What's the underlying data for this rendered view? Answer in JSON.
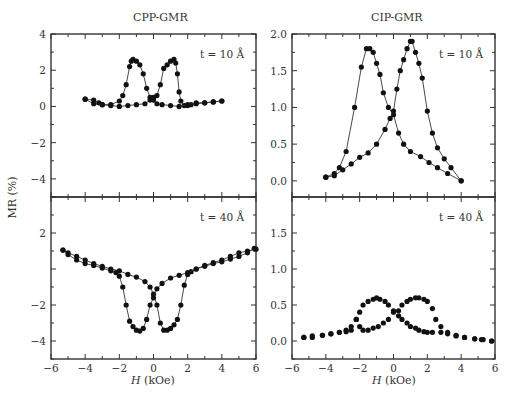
{
  "figure": {
    "left_title": "CPP-GMR",
    "right_title": "CIP-GMR",
    "ylabel": "MR (%)",
    "xlabel_var": "H",
    "xlabel_unit": " (kOe)"
  },
  "chart_data": [
    {
      "type": "line",
      "title": "CPP-GMR",
      "annotation": "t = 10 Å",
      "xlabel": "H (kOe)",
      "ylabel": "MR (%)",
      "xlim": [
        -6,
        6
      ],
      "ylim": [
        -5,
        4
      ],
      "xticks": [
        -6,
        -4,
        -2,
        0,
        2,
        4,
        6
      ],
      "yticks": [
        -4,
        -2,
        0,
        2,
        4
      ],
      "series": [
        {
          "name": "decreasing",
          "x": [
            4.0,
            3.5,
            3.0,
            2.5,
            2.2,
            2.0,
            1.8,
            1.6,
            1.5,
            1.4,
            1.3,
            1.2,
            1.0,
            0.8,
            0.6,
            0.4,
            0.2,
            0.0,
            -0.2,
            -0.5,
            -1.0,
            -1.5,
            -2.0,
            -2.5,
            -3.0,
            -3.5,
            -4.0
          ],
          "y": [
            0.3,
            0.25,
            0.2,
            0.15,
            0.1,
            0.05,
            0.05,
            0.3,
            0.8,
            1.8,
            2.4,
            2.6,
            2.5,
            2.3,
            2.1,
            1.2,
            0.6,
            0.5,
            0.35,
            0.15,
            0.1,
            0.05,
            0.0,
            0.05,
            0.1,
            0.15,
            0.4
          ]
        },
        {
          "name": "increasing",
          "x": [
            -4.0,
            -3.5,
            -3.2,
            -3.0,
            -2.5,
            -2.0,
            -1.8,
            -1.6,
            -1.4,
            -1.3,
            -1.2,
            -1.0,
            -0.8,
            -0.6,
            -0.4,
            -0.2,
            0.0,
            0.2,
            0.5,
            1.0,
            1.5,
            2.0,
            2.5,
            3.0,
            3.5,
            4.0
          ],
          "y": [
            0.4,
            0.35,
            0.2,
            0.1,
            0.1,
            0.3,
            0.6,
            1.2,
            2.2,
            2.5,
            2.6,
            2.5,
            2.3,
            1.8,
            1.0,
            0.5,
            0.35,
            0.15,
            0.1,
            0.05,
            0.0,
            0.1,
            0.2,
            0.2,
            0.25,
            0.3
          ]
        }
      ]
    },
    {
      "type": "line",
      "title": "CPP-GMR",
      "annotation": "t = 40 Å",
      "xlabel": "H (kOe)",
      "ylabel": "MR (%)",
      "xlim": [
        -6,
        6
      ],
      "ylim": [
        -5,
        4
      ],
      "xticks": [
        -6,
        -4,
        -2,
        0,
        2,
        4,
        6
      ],
      "yticks": [
        -4,
        -2,
        2
      ],
      "series": [
        {
          "name": "decreasing",
          "x": [
            6.0,
            5.5,
            5.0,
            4.5,
            4.0,
            3.5,
            3.0,
            2.5,
            2.2,
            2.0,
            1.8,
            1.6,
            1.4,
            1.2,
            1.0,
            0.8,
            0.6,
            0.4,
            0.2,
            0.0,
            -0.2,
            -0.5,
            -1.0,
            -1.5,
            -2.0,
            -2.5,
            -3.0,
            -3.5,
            -4.0,
            -4.5,
            -5.0,
            -5.3
          ],
          "y": [
            1.1,
            1.0,
            0.9,
            0.7,
            0.5,
            0.35,
            0.2,
            0.0,
            -0.15,
            -0.3,
            -0.9,
            -2.0,
            -2.8,
            -3.1,
            -3.3,
            -3.4,
            -3.4,
            -3.0,
            -2.0,
            -1.4,
            -1.0,
            -0.7,
            -0.45,
            -0.3,
            -0.1,
            0.0,
            0.15,
            0.3,
            0.5,
            0.7,
            0.9,
            1.05
          ]
        },
        {
          "name": "increasing",
          "x": [
            -5.3,
            -5.0,
            -4.5,
            -4.0,
            -3.5,
            -3.0,
            -2.5,
            -2.2,
            -2.0,
            -1.8,
            -1.6,
            -1.4,
            -1.2,
            -1.0,
            -0.8,
            -0.6,
            -0.4,
            -0.2,
            0.0,
            0.2,
            0.5,
            1.0,
            1.5,
            2.0,
            2.5,
            3.0,
            3.5,
            4.0,
            4.5,
            5.0,
            5.5,
            5.9
          ],
          "y": [
            1.05,
            0.8,
            0.5,
            0.3,
            0.2,
            0.05,
            -0.1,
            -0.2,
            -0.4,
            -1.0,
            -2.0,
            -2.9,
            -3.2,
            -3.4,
            -3.45,
            -3.3,
            -2.8,
            -2.0,
            -1.6,
            -1.1,
            -0.8,
            -0.5,
            -0.35,
            -0.2,
            0.0,
            0.15,
            0.3,
            0.4,
            0.55,
            0.7,
            0.9,
            1.15
          ]
        }
      ]
    },
    {
      "type": "line",
      "title": "CIP-GMR",
      "annotation": "t = 10 Å",
      "xlabel": "H (kOe)",
      "ylabel": "MR (%)",
      "xlim": [
        -6,
        6
      ],
      "ylim": [
        -0.22,
        2.0
      ],
      "xticks": [
        -6,
        -4,
        -2,
        0,
        2,
        4,
        6
      ],
      "yticks": [
        0.0,
        0.5,
        1.0,
        1.5,
        2.0
      ],
      "series": [
        {
          "name": "decreasing",
          "x": [
            4.0,
            3.2,
            2.6,
            2.1,
            1.6,
            1.0,
            0.6,
            0.3,
            0.0,
            -0.3,
            -0.6,
            -0.8,
            -1.0,
            -1.2,
            -1.4,
            -1.6,
            -1.9,
            -2.3,
            -2.8,
            -3.2,
            -3.5,
            -4.0
          ],
          "y": [
            0.0,
            0.1,
            0.18,
            0.25,
            0.33,
            0.4,
            0.5,
            0.65,
            0.9,
            1.0,
            1.2,
            1.45,
            1.6,
            1.75,
            1.8,
            1.8,
            1.55,
            1.0,
            0.4,
            0.18,
            0.1,
            0.05
          ]
        },
        {
          "name": "increasing",
          "x": [
            -4.0,
            -3.5,
            -3.0,
            -2.5,
            -2.0,
            -1.5,
            -1.0,
            -0.5,
            -0.2,
            0.0,
            0.2,
            0.4,
            0.6,
            0.8,
            1.0,
            1.1,
            1.3,
            1.5,
            1.7,
            2.0,
            2.3,
            2.6,
            3.0,
            3.4,
            4.0
          ],
          "y": [
            0.05,
            0.07,
            0.15,
            0.23,
            0.32,
            0.38,
            0.5,
            0.7,
            0.85,
            0.95,
            1.25,
            1.5,
            1.65,
            1.8,
            1.9,
            1.9,
            1.75,
            1.6,
            1.4,
            0.95,
            0.65,
            0.45,
            0.3,
            0.18,
            0.0
          ]
        }
      ]
    },
    {
      "type": "scatter",
      "title": "CIP-GMR",
      "annotation": "t = 40 Å",
      "xlabel": "H (kOe)",
      "ylabel": "MR (%)",
      "xlim": [
        -6,
        6
      ],
      "ylim": [
        -0.25,
        2.0
      ],
      "xticks": [
        -6,
        -4,
        -2,
        0,
        2,
        4,
        6
      ],
      "yticks": [
        0.0,
        0.5,
        1.0,
        1.5
      ],
      "series": [
        {
          "name": "decreasing",
          "x": [
            5.8,
            5.2,
            4.8,
            4.2,
            3.7,
            3.2,
            2.8,
            2.5,
            2.3,
            2.0,
            1.8,
            1.5,
            1.3,
            1.0,
            0.8,
            0.5,
            0.3,
            0.0,
            -0.3,
            -0.6,
            -0.9,
            -1.2,
            -1.5,
            -1.8,
            -2.0,
            -2.2,
            -2.5,
            -2.8,
            -3.2,
            -3.7,
            -4.2,
            -4.8,
            -5.3
          ],
          "y": [
            0.0,
            0.02,
            0.03,
            0.05,
            0.07,
            0.12,
            0.2,
            0.3,
            0.45,
            0.55,
            0.58,
            0.6,
            0.6,
            0.58,
            0.55,
            0.5,
            0.42,
            0.4,
            0.3,
            0.25,
            0.2,
            0.18,
            0.15,
            0.15,
            0.2,
            0.3,
            0.15,
            0.13,
            0.12,
            0.1,
            0.08,
            0.05,
            0.05
          ]
        },
        {
          "name": "increasing",
          "x": [
            -5.3,
            -4.8,
            -4.2,
            -3.7,
            -3.2,
            -2.8,
            -2.5,
            -2.2,
            -2.0,
            -1.8,
            -1.5,
            -1.2,
            -1.0,
            -0.8,
            -0.5,
            -0.3,
            0.0,
            0.3,
            0.5,
            0.8,
            1.0,
            1.3,
            1.5,
            1.8,
            2.0,
            2.3,
            2.8,
            3.2,
            3.7,
            4.2,
            4.8,
            5.3,
            5.8
          ],
          "y": [
            0.05,
            0.07,
            0.08,
            0.1,
            0.12,
            0.15,
            0.2,
            0.3,
            0.4,
            0.5,
            0.55,
            0.58,
            0.6,
            0.58,
            0.55,
            0.5,
            0.42,
            0.35,
            0.3,
            0.25,
            0.2,
            0.18,
            0.15,
            0.13,
            0.12,
            0.12,
            0.12,
            0.1,
            0.08,
            0.05,
            0.03,
            0.02,
            0.0
          ]
        }
      ]
    }
  ]
}
